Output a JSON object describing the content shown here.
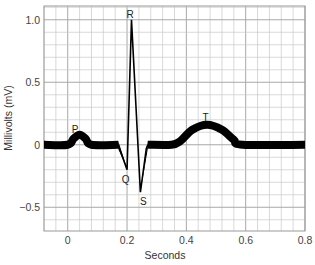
{
  "chart_data": {
    "type": "line",
    "title": "",
    "xlabel": "Seconds",
    "ylabel": "Millivolts (mV)",
    "xlim": [
      -0.08,
      0.8
    ],
    "ylim": [
      -0.69,
      1.11
    ],
    "grid": true,
    "grid_minor_x": 0.04,
    "grid_minor_y": 0.1,
    "legend": null,
    "x_ticks": [
      0,
      0.2,
      0.4,
      0.6,
      0.8
    ],
    "x_tick_labels": [
      "0",
      "0.2",
      "0.4",
      "0.6",
      "0.8"
    ],
    "y_ticks": [
      1.0,
      0.5,
      0,
      -0.5
    ],
    "y_tick_labels": [
      "1.0",
      "0.5",
      "0",
      "−0.5"
    ],
    "series": [
      {
        "name": "ECG waveform",
        "x": [
          -0.08,
          0.0,
          0.02,
          0.04,
          0.06,
          0.08,
          0.17,
          0.2,
          0.215,
          0.245,
          0.265,
          0.27,
          0.35,
          0.38,
          0.42,
          0.47,
          0.52,
          0.56,
          0.59,
          0.8
        ],
        "y": [
          0,
          0,
          0.05,
          0.08,
          0.05,
          0,
          0,
          -0.2,
          1.0,
          -0.38,
          -0.03,
          0,
          0,
          0.03,
          0.12,
          0.16,
          0.12,
          0.04,
          0,
          0
        ]
      }
    ],
    "annotations": [
      {
        "text": "P",
        "x": 0.025,
        "y": 0.13
      },
      {
        "text": "R",
        "x": 0.21,
        "y": 1.05
      },
      {
        "text": "Q",
        "x": 0.195,
        "y": -0.27
      },
      {
        "text": "S",
        "x": 0.255,
        "y": -0.45
      },
      {
        "text": "T",
        "x": 0.465,
        "y": 0.22
      }
    ],
    "colors": {
      "line": "#000000",
      "grid": "#c8c8c8",
      "grid_major": "#a8a8a8",
      "frame": "#999999"
    }
  }
}
